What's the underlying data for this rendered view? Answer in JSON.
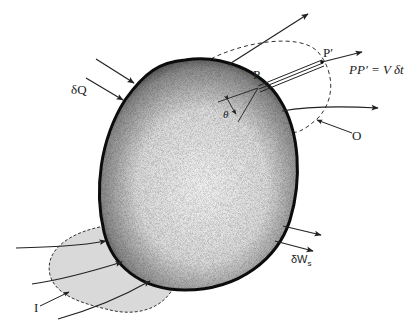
{
  "diagram": {
    "type": "control-volume",
    "colors": {
      "body_edge": "#111111",
      "body_fill_light": "#f2f2f2",
      "inlet_region_fill": "#d9d9d9",
      "dashed_line": "#333333",
      "arrow": "#222222"
    },
    "labels": {
      "heat": "δQ",
      "point_p": "P",
      "point_p_prime": "P′",
      "displacement": "PP′ = V δt",
      "angle": "θ",
      "outlet": "O",
      "inlet": "I",
      "work": "δW",
      "work_sub": "s"
    }
  }
}
